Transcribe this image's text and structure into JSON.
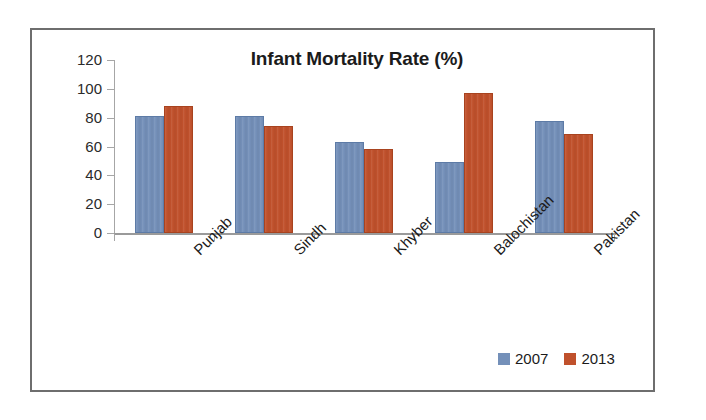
{
  "chart_data": {
    "type": "bar",
    "title": "Infant Mortality Rate (%)",
    "xlabel": "",
    "ylabel": "",
    "ylim": [
      0,
      120
    ],
    "yticks": [
      0,
      20,
      40,
      60,
      80,
      100,
      120
    ],
    "grid": false,
    "legend_position": "bottom-right",
    "categories": [
      "Punjab",
      "Sindh",
      "Khyber",
      "Balochistan",
      "Pakistan"
    ],
    "series": [
      {
        "name": "2007",
        "color": "#7490b9",
        "values": [
          81,
          81,
          63,
          49,
          78
        ]
      },
      {
        "name": "2013",
        "color": "#c0512c",
        "values": [
          88,
          74,
          58,
          97,
          69
        ]
      }
    ]
  },
  "axis": {
    "tick_labels": [
      "120",
      "100",
      "80",
      "60",
      "40",
      "20",
      "0"
    ]
  },
  "legend": {
    "items": [
      {
        "label": "2007",
        "swatch": "legend-swatch-2007"
      },
      {
        "label": "2013",
        "swatch": "legend-swatch-2013"
      }
    ]
  }
}
